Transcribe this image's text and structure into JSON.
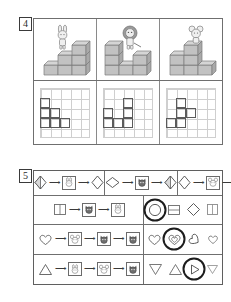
{
  "page": {
    "background": "#ffffff",
    "ink": "#3a3a3a"
  },
  "exercises": [
    {
      "number": "4",
      "name": "cube-stacks-and-grid-plans",
      "columns": [
        {
          "name": "column-rabbit",
          "animal": "rabbit-icon",
          "scene_description": "rabbit standing on top of a 3-step cube staircase",
          "cubes": [
            {
              "col": 0,
              "row": 0
            },
            {
              "col": 1,
              "row": 0
            },
            {
              "col": 2,
              "row": 0
            },
            {
              "col": 1,
              "row": 1
            },
            {
              "col": 2,
              "row": 1
            },
            {
              "col": 2,
              "row": 2
            }
          ],
          "grid": {
            "cols": 5,
            "rows": 5,
            "filled": [
              [
                0,
                1
              ],
              [
                0,
                2
              ],
              [
                1,
                2
              ],
              [
                1,
                3
              ],
              [
                2,
                3
              ],
              [
                0,
                3
              ]
            ]
          }
        },
        {
          "name": "column-lion",
          "animal": "lion-icon",
          "scene_description": "lion standing on a tall cube tower beside a lower block",
          "cubes": [
            {
              "col": 0,
              "row": 0
            },
            {
              "col": 1,
              "row": 0
            },
            {
              "col": 2,
              "row": 0
            },
            {
              "col": 0,
              "row": 1
            },
            {
              "col": 2,
              "row": 1
            },
            {
              "col": 0,
              "row": 2
            }
          ],
          "grid": {
            "cols": 5,
            "rows": 5,
            "filled": [
              [
                0,
                2
              ],
              [
                0,
                3
              ],
              [
                1,
                3
              ],
              [
                2,
                1
              ],
              [
                2,
                2
              ],
              [
                2,
                3
              ]
            ]
          }
        },
        {
          "name": "column-mouse",
          "animal": "mouse-icon",
          "scene_description": "mouse above an L-shaped cube stack",
          "cubes": [
            {
              "col": 0,
              "row": 0
            },
            {
              "col": 1,
              "row": 0
            },
            {
              "col": 2,
              "row": 0
            },
            {
              "col": 0,
              "row": 1
            },
            {
              "col": 1,
              "row": 1
            },
            {
              "col": 1,
              "row": 2
            }
          ],
          "grid": {
            "cols": 5,
            "rows": 5,
            "filled": [
              [
                1,
                1
              ],
              [
                1,
                2
              ],
              [
                2,
                2
              ],
              [
                0,
                3
              ],
              [
                1,
                3
              ]
            ]
          }
        }
      ]
    },
    {
      "number": "5",
      "name": "shape-transformation-machines",
      "top_row": [
        {
          "name": "machine-chain-1",
          "input_shape": "diamond-half-filled",
          "machines": [
            "rabbit-icon"
          ],
          "output_shape": "diamond-plain"
        },
        {
          "name": "machine-chain-2",
          "input_shape": "diamond-wide",
          "machines": [
            "cat-icon"
          ],
          "output_shape": "diamond-half-filled"
        },
        {
          "name": "machine-chain-3",
          "input_shape": "diamond-plain",
          "machines": [
            "mouse-icon"
          ],
          "output_shape": "diamond-nested"
        }
      ],
      "puzzle_rows": [
        {
          "name": "puzzle-row-1",
          "input_shape": "rectangle-split",
          "machines": [
            "cat-icon",
            "rabbit-icon"
          ],
          "options": [
            "circle",
            "rectangle-striped",
            "diamond-plain",
            "rectangle-split"
          ],
          "selected_index": 0
        },
        {
          "name": "puzzle-row-2",
          "input_shape": "heart",
          "machines": [
            "mouse-icon",
            "cat-icon",
            "cat-icon"
          ],
          "options": [
            "heart-plain",
            "heart-nested",
            "heart-rotated",
            "heart-small"
          ],
          "selected_index": 1
        },
        {
          "name": "puzzle-row-3",
          "input_shape": "triangle-up",
          "machines": [
            "rabbit-icon",
            "mouse-icon",
            "cat-icon"
          ],
          "options": [
            "triangle-down",
            "triangle-up",
            "triangle-right",
            "triangle-down-small"
          ],
          "selected_index": 2
        }
      ]
    }
  ]
}
